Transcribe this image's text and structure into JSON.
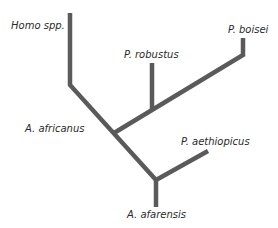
{
  "diagram": {
    "type": "cladogram",
    "line_color": "#5a5a5a",
    "text_color": "#2a2a2a",
    "taxa": [
      {
        "id": "homo",
        "label": "Homo spp."
      },
      {
        "id": "robustus",
        "label": "P. robustus"
      },
      {
        "id": "boisei",
        "label": "P. boisei"
      },
      {
        "id": "africanus",
        "label": "A. africanus"
      },
      {
        "id": "aethiopicus",
        "label": "P. aethiopicus"
      },
      {
        "id": "afarensis",
        "label": "A. afarensis"
      }
    ]
  }
}
